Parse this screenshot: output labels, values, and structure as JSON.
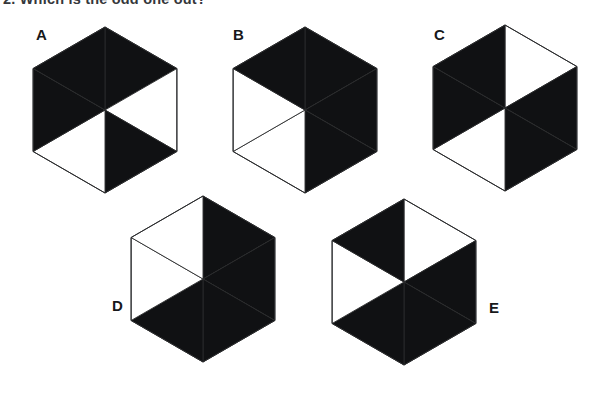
{
  "question": {
    "number": "2.",
    "text": "2.  Which is the odd one out?"
  },
  "colors": {
    "fill_black": "#101113",
    "fill_white": "#ffffff",
    "outline": "#2a2b2d",
    "background": "#ffffff",
    "label": "#17181a"
  },
  "puzzle": {
    "type": "odd-one-out",
    "shape": "hexagon",
    "segments_per_shape": 6,
    "segment_order": [
      "top",
      "upper-right",
      "lower-right",
      "bottom",
      "lower-left",
      "upper-left"
    ],
    "option_count": 5
  },
  "options": [
    {
      "id": "A",
      "label": "A",
      "label_x": 36,
      "label_y": 40,
      "center_x": 105,
      "center_y": 110,
      "radius_x": 83,
      "radius_y": 83,
      "rotation": 0,
      "segments": {
        "top": "black",
        "upper-right": "white",
        "lower-right": "black",
        "bottom": "white",
        "lower-left": "black",
        "upper-left": "black"
      },
      "black_count": 4,
      "white_count": 2
    },
    {
      "id": "B",
      "label": "B",
      "label_x": 233,
      "label_y": 40,
      "center_x": 305,
      "center_y": 110,
      "radius_x": 83,
      "radius_y": 83,
      "rotation": 0,
      "segments": {
        "top": "black",
        "upper-right": "black",
        "lower-right": "black",
        "bottom": "white",
        "lower-left": "white",
        "upper-left": "black"
      },
      "black_count": 4,
      "white_count": 2
    },
    {
      "id": "C",
      "label": "C",
      "label_x": 434,
      "label_y": 40,
      "center_x": 505,
      "center_y": 108,
      "radius_x": 83,
      "radius_y": 83,
      "rotation": 0,
      "segments": {
        "top": "white",
        "upper-right": "black",
        "lower-right": "black",
        "bottom": "white",
        "lower-left": "black",
        "upper-left": "black"
      },
      "black_count": 4,
      "white_count": 2
    },
    {
      "id": "D",
      "label": "D",
      "label_x": 112,
      "label_y": 311,
      "center_x": 203,
      "center_y": 279,
      "radius_x": 83,
      "radius_y": 83,
      "rotation": 0,
      "segments": {
        "top": "black",
        "upper-right": "black",
        "lower-right": "black",
        "bottom": "black",
        "lower-left": "white",
        "upper-left": "white"
      },
      "black_count": 4,
      "white_count": 2
    },
    {
      "id": "E",
      "label": "E",
      "label_x": 489,
      "label_y": 313,
      "center_x": 404,
      "center_y": 282,
      "radius_x": 83,
      "radius_y": 83,
      "rotation": 0,
      "segments": {
        "top": "white",
        "upper-right": "black",
        "lower-right": "black",
        "bottom": "black",
        "lower-left": "white",
        "upper-left": "black"
      },
      "black_count": 4,
      "white_count": 2
    }
  ]
}
